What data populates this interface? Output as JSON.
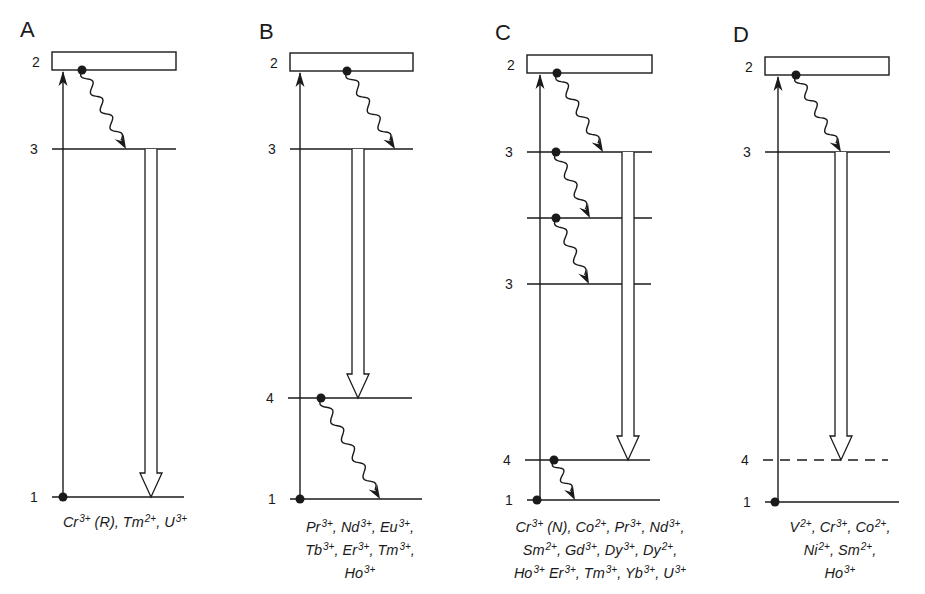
{
  "figure": {
    "line_color": "#1a1a1a",
    "background": "#ffffff"
  },
  "panels": [
    {
      "id": "A",
      "letter": "A",
      "box": {
        "x1": 52,
        "x2": 176,
        "y1": 52,
        "y2": 70,
        "label": "2"
      },
      "pump_x": 63,
      "levels": [
        {
          "label": "3",
          "y": 149,
          "x1": 52,
          "x2": 176,
          "style": "solid"
        },
        {
          "label": "1",
          "y": 497,
          "x1": 52,
          "x2": 184,
          "style": "solid"
        }
      ],
      "ground_dot": {
        "x": 63,
        "y": 497
      },
      "relaxations": [
        {
          "from_x": 82,
          "from_y": 70,
          "to_x": 126,
          "to_y": 149
        }
      ],
      "laser": {
        "x": 151,
        "y_top": 149,
        "y_bottom": 497
      },
      "ions": {
        "x": 30,
        "y": 509,
        "width": 190,
        "lines": [
          [
            {
              "s": "Cr",
              "c": "3+"
            },
            {
              "t": " (R), "
            },
            {
              "s": "Tm",
              "c": "2+"
            },
            {
              "t": ", "
            },
            {
              "s": "U",
              "c": "3+"
            }
          ]
        ]
      }
    },
    {
      "id": "B",
      "letter": "B",
      "box": {
        "x1": 290,
        "x2": 413,
        "y1": 53,
        "y2": 71,
        "label": "2"
      },
      "pump_x": 300,
      "levels": [
        {
          "label": "3",
          "y": 149,
          "x1": 290,
          "x2": 413,
          "style": "solid"
        },
        {
          "label": "4",
          "y": 398,
          "x1": 288,
          "x2": 412,
          "style": "solid"
        },
        {
          "label": "1",
          "y": 499,
          "x1": 290,
          "x2": 422,
          "style": "solid"
        }
      ],
      "ground_dot": {
        "x": 300,
        "y": 499
      },
      "relaxations": [
        {
          "from_x": 347,
          "from_y": 71,
          "to_x": 395,
          "to_y": 149
        },
        {
          "from_x": 321,
          "from_y": 398,
          "to_x": 380,
          "to_y": 499
        }
      ],
      "laser": {
        "x": 358,
        "y_top": 149,
        "y_bottom": 398
      },
      "ions": {
        "x": 255,
        "y": 514,
        "width": 210,
        "lines": [
          [
            {
              "s": "Pr",
              "c": "3+"
            },
            {
              "t": ", "
            },
            {
              "s": "Nd",
              "c": "3+"
            },
            {
              "t": ", "
            },
            {
              "s": "Eu",
              "c": "3+"
            },
            {
              "t": ","
            }
          ],
          [
            {
              "s": "Tb",
              "c": "3+"
            },
            {
              "t": ", "
            },
            {
              "s": "Er",
              "c": "3+"
            },
            {
              "t": ", "
            },
            {
              "s": "Tm",
              "c": "3+"
            },
            {
              "t": ","
            }
          ],
          [
            {
              "s": "Ho",
              "c": "3+"
            }
          ]
        ]
      }
    },
    {
      "id": "C",
      "letter": "C",
      "box": {
        "x1": 527,
        "x2": 652,
        "y1": 55,
        "y2": 73,
        "label": "2"
      },
      "pump_x": 540,
      "levels": [
        {
          "label": "3",
          "y": 152,
          "x1": 527,
          "x2": 652,
          "style": "solid"
        },
        {
          "label": "",
          "y": 218,
          "x1": 527,
          "x2": 652,
          "style": "solid"
        },
        {
          "label": "3",
          "y": 284,
          "x1": 527,
          "x2": 651,
          "style": "solid"
        },
        {
          "label": "4",
          "y": 460,
          "x1": 525,
          "x2": 650,
          "style": "solid"
        },
        {
          "label": "1",
          "y": 500,
          "x1": 527,
          "x2": 660,
          "style": "solid"
        }
      ],
      "ground_dot": {
        "x": 537,
        "y": 500
      },
      "relaxations": [
        {
          "from_x": 557,
          "from_y": 73,
          "to_x": 603,
          "to_y": 152
        },
        {
          "from_x": 556,
          "from_y": 152,
          "to_x": 590,
          "to_y": 218
        },
        {
          "from_x": 556,
          "from_y": 218,
          "to_x": 589,
          "to_y": 284
        },
        {
          "from_x": 554,
          "from_y": 460,
          "to_x": 575,
          "to_y": 500
        }
      ],
      "laser": {
        "x": 628,
        "y_top": 152,
        "y_bottom": 460
      },
      "ions": {
        "x": 480,
        "y": 514,
        "width": 240,
        "lines": [
          [
            {
              "s": "Cr",
              "c": "3+"
            },
            {
              "t": " (N), "
            },
            {
              "s": "Co",
              "c": "2+"
            },
            {
              "t": ", "
            },
            {
              "s": "Pr",
              "c": "3+"
            },
            {
              "t": ", "
            },
            {
              "s": "Nd",
              "c": "3+"
            },
            {
              "t": ","
            }
          ],
          [
            {
              "s": "Sm",
              "c": "2+"
            },
            {
              "t": ", "
            },
            {
              "s": "Gd",
              "c": "3+"
            },
            {
              "t": ", "
            },
            {
              "s": "Dy",
              "c": "3+"
            },
            {
              "t": ", "
            },
            {
              "s": "Dy",
              "c": "2+"
            },
            {
              "t": ","
            }
          ],
          [
            {
              "s": "Ho",
              "c": "3+"
            },
            {
              "t": " "
            },
            {
              "s": "Er",
              "c": "3+"
            },
            {
              "t": ", "
            },
            {
              "s": "Tm",
              "c": "3+"
            },
            {
              "t": ", "
            },
            {
              "s": "Yb",
              "c": "3+"
            },
            {
              "t": ", "
            },
            {
              "s": "U",
              "c": "3+"
            }
          ]
        ]
      }
    },
    {
      "id": "D",
      "letter": "D",
      "box": {
        "x1": 765,
        "x2": 889,
        "y1": 57,
        "y2": 75,
        "label": "2"
      },
      "pump_x": 778,
      "levels": [
        {
          "label": "3",
          "y": 152,
          "x1": 765,
          "x2": 890,
          "style": "solid"
        },
        {
          "label": "4",
          "y": 460,
          "x1": 763,
          "x2": 888,
          "style": "dashed"
        },
        {
          "label": "1",
          "y": 502,
          "x1": 765,
          "x2": 899,
          "style": "solid"
        }
      ],
      "ground_dot": {
        "x": 775,
        "y": 502
      },
      "relaxations": [
        {
          "from_x": 796,
          "from_y": 75,
          "to_x": 841,
          "to_y": 152
        }
      ],
      "laser": {
        "x": 841,
        "y_top": 152,
        "y_bottom": 460
      },
      "ions": {
        "x": 745,
        "y": 514,
        "width": 190,
        "lines": [
          [
            {
              "s": "V",
              "c": "2+"
            },
            {
              "t": ", "
            },
            {
              "s": "Cr",
              "c": "3+"
            },
            {
              "t": ", "
            },
            {
              "s": "Co",
              "c": "2+"
            },
            {
              "t": ","
            }
          ],
          [
            {
              "s": "Ni",
              "c": "2+"
            },
            {
              "t": ", "
            },
            {
              "s": "Sm",
              "c": "2+"
            },
            {
              "t": ","
            }
          ],
          [
            {
              "s": "Ho",
              "c": "3+"
            }
          ]
        ]
      }
    }
  ],
  "panel_letter_positions": [
    {
      "x": 20,
      "y": 37
    },
    {
      "x": 259,
      "y": 39
    },
    {
      "x": 495,
      "y": 40
    },
    {
      "x": 733,
      "y": 42
    }
  ]
}
